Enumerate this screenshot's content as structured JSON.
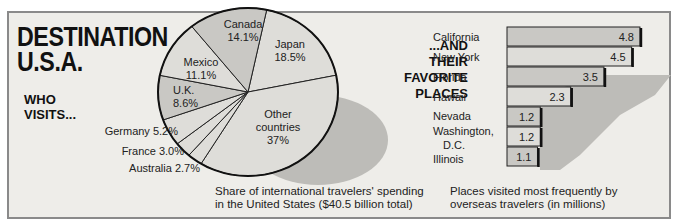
{
  "title": {
    "line1": "DESTINATION",
    "line2": "U.S.A."
  },
  "left_heading": {
    "line1": "WHO",
    "line2": "VISITS..."
  },
  "right_heading": {
    "line1": "...AND",
    "line2": "THEIR",
    "line3": "FAVORITE",
    "line4": "PLACES"
  },
  "pie_caption": {
    "line1": "Share of international travelers' spending",
    "line2": "in the United States ($40.5 billion total)"
  },
  "bar_caption": {
    "line1": "Places visited most frequently by",
    "line2": "overseas travelers (in millions)"
  },
  "colors": {
    "background": "#eeede9",
    "slice_dark": "#c9c8c4",
    "slice_light": "#deddd9",
    "shadow": "#bdbcb8"
  },
  "chart_data": [
    {
      "type": "pie",
      "title": "Share of international travelers' spending in the United States ($40.5 billion total)",
      "categories": [
        "Japan",
        "Other countries",
        "Australia",
        "France",
        "Germany",
        "U.K.",
        "Mexico",
        "Canada"
      ],
      "values": [
        18.5,
        37,
        2.7,
        3.0,
        5.2,
        8.6,
        11.1,
        14.1
      ],
      "labels": [
        "Japan 18.5%",
        "Other countries 37%",
        "Australia 2.7%",
        "France 3.0%",
        "Germany 5.2%",
        "U.K. 8.6%",
        "Mexico 11.1%",
        "Canada 14.1%"
      ]
    },
    {
      "type": "bar",
      "orientation": "horizontal",
      "title": "Places visited most frequently by overseas travelers (in millions)",
      "categories": [
        "California",
        "New York",
        "Florida",
        "Hawaii",
        "Nevada",
        "Washington, D.C.",
        "Illinois"
      ],
      "values": [
        4.8,
        4.5,
        3.5,
        2.3,
        1.2,
        1.2,
        1.1
      ],
      "value_labels": [
        "4.8",
        "4.5",
        "3.5",
        "2.3",
        "1.2",
        "1.2",
        "1.1"
      ]
    }
  ]
}
